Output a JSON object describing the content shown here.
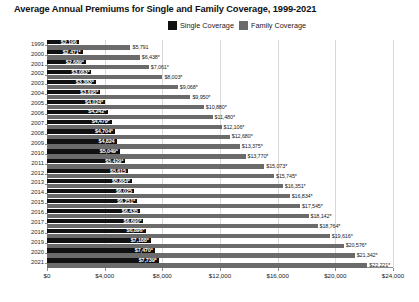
{
  "chart_data": {
    "type": "bar",
    "orientation": "horizontal",
    "title": "Average Annual Premiums for Single and Family Coverage, 1999-2021",
    "xlabel": "",
    "ylabel": "",
    "xlim": [
      0,
      24000
    ],
    "xticks": [
      0,
      4000,
      8000,
      12000,
      16000,
      20000,
      24000
    ],
    "xtick_labels": [
      "$0",
      "$4,000",
      "$8,000",
      "$12,000",
      "$16,000",
      "$20,000",
      "$24,000"
    ],
    "grid": true,
    "legend_position": "top-center",
    "categories": [
      "1999",
      "2000",
      "2001",
      "2002",
      "2003",
      "2004",
      "2005",
      "2006",
      "2007",
      "2008",
      "2009",
      "2010",
      "2011",
      "2012",
      "2013",
      "2014",
      "2015",
      "2016",
      "2017",
      "2018",
      "2019",
      "2020",
      "2021"
    ],
    "series": [
      {
        "name": "Single Coverage",
        "color": "#111111",
        "values": [
          2196,
          2471,
          2689,
          3083,
          3383,
          3695,
          4024,
          4242,
          4479,
          4704,
          4824,
          5049,
          5429,
          5615,
          5884,
          6025,
          6251,
          6435,
          6690,
          6896,
          7188,
          7470,
          7739
        ],
        "labels": [
          "$2,196",
          "$2,471*",
          "$2,689*",
          "$3,083*",
          "$3,383*",
          "$3,695*",
          "$4,024*",
          "$4,242*",
          "$4,479*",
          "$4,704*",
          "$4,824",
          "$5,049*",
          "$5,429*",
          "$5,615",
          "$5,884*",
          "$6,025",
          "$6,251*",
          "$6,435",
          "$6,690*",
          "$6,896*",
          "$7,188*",
          "$7,470*",
          "$7,739*"
        ]
      },
      {
        "name": "Family Coverage",
        "color": "#6b6b6b",
        "values": [
          5791,
          6438,
          7061,
          8003,
          9068,
          9950,
          10880,
          11480,
          12106,
          12680,
          13375,
          13770,
          15073,
          15745,
          16351,
          16834,
          17545,
          18142,
          18764,
          19616,
          20576,
          21342,
          22221
        ],
        "labels": [
          "$5,791",
          "$6,438*",
          "$7,061*",
          "$8,003*",
          "$9,068*",
          "$9,950*",
          "$10,880*",
          "$11,480*",
          "$12,106*",
          "$12,680*",
          "$13,375*",
          "$13,770*",
          "$15,073*",
          "$15,745*",
          "$16,351*",
          "$16,834*",
          "$17,545*",
          "$18,142*",
          "$18,764*",
          "$19,616*",
          "$20,576*",
          "$21,342*",
          "$22,221*"
        ]
      }
    ]
  },
  "legend": {
    "items": [
      {
        "label": "Single Coverage",
        "color": "#111111"
      },
      {
        "label": "Family Coverage",
        "color": "#6b6b6b"
      }
    ]
  },
  "footnote": ""
}
